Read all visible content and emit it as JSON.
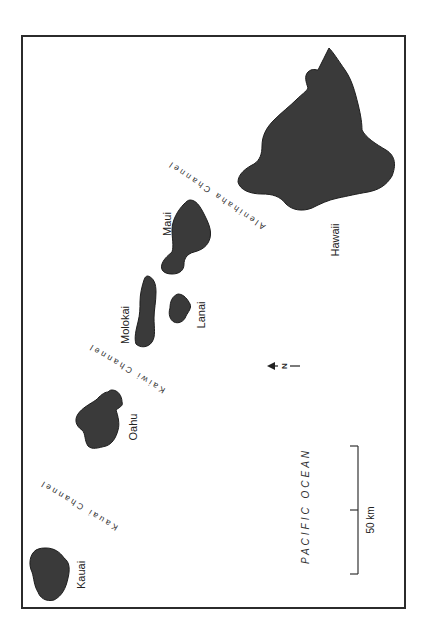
{
  "map": {
    "title": "Hawaiian Islands",
    "islands": [
      {
        "id": "hawaii",
        "label": "Hawaii"
      },
      {
        "id": "maui",
        "label": "Maui"
      },
      {
        "id": "molokai",
        "label": "Molokai"
      },
      {
        "id": "lanai",
        "label": "Lanai"
      },
      {
        "id": "oahu",
        "label": "Oahu"
      },
      {
        "id": "kauai",
        "label": "Kauai"
      }
    ],
    "channels": [
      {
        "id": "alenihaha",
        "label": "Alenihaha Channel"
      },
      {
        "id": "kaiwi",
        "label": "Kaiwi Channel"
      },
      {
        "id": "kauai",
        "label": "Kauai Channel"
      }
    ],
    "ocean_label": "PACIFIC OCEAN",
    "scale": {
      "label": "50 km",
      "value": 50,
      "unit": "km"
    },
    "north_arrow": {
      "label": "N",
      "icon": "north-arrow-icon"
    },
    "colors": {
      "land": "#3a3a3a",
      "water": "#ffffff",
      "frame": "#2b2b2b"
    }
  }
}
